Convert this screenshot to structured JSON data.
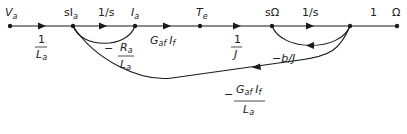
{
  "diagram": {
    "type": "signal-flow-graph",
    "nodes": [
      {
        "id": "Va",
        "label": "V_a",
        "x": 10,
        "y": 26
      },
      {
        "id": "sIa",
        "label": "sI_a",
        "x": 73,
        "y": 26
      },
      {
        "id": "Ia",
        "label": "I_a",
        "x": 135,
        "y": 26
      },
      {
        "id": "Te",
        "label": "T_e",
        "x": 200,
        "y": 26
      },
      {
        "id": "sOmega",
        "label": "sΩ",
        "x": 272,
        "y": 26
      },
      {
        "id": "n6",
        "label": "",
        "x": 350,
        "y": 26
      },
      {
        "id": "Omega",
        "label": "Ω",
        "x": 397,
        "y": 26
      }
    ],
    "labels": {
      "va": "V",
      "va_sub": "a",
      "sia": "sI",
      "sia_sub": "a",
      "ia": "I",
      "ia_sub": "a",
      "te": "T",
      "te_sub": "e",
      "somega": "sΩ",
      "omega": "Ω",
      "gain_1_over_s_a": "1/s",
      "gain_1_over_s_b": "1/s",
      "gain_one": "1",
      "gain_1_over_La_num": "1",
      "gain_1_over_La_den": "L",
      "gain_1_over_La_den_sub": "a",
      "gain_Ra_minus": "−",
      "gain_Ra_num": "R",
      "gain_Ra_num_sub": "a",
      "gain_Ra_den": "L",
      "gain_Ra_den_sub": "a",
      "gain_GafIf_G": "G",
      "gain_GafIf_G_sub": "af",
      "gain_GafIf_I": "I",
      "gain_GafIf_I_sub": "f",
      "gain_1_over_J_num": "1",
      "gain_1_over_J_den": "J",
      "gain_bJ": "−b/J",
      "gain_fb_minus": "−",
      "gain_fb_G": "G",
      "gain_fb_G_sub": "af",
      "gain_fb_I": "I",
      "gain_fb_I_sub": "f",
      "gain_fb_den": "L",
      "gain_fb_den_sub": "a"
    },
    "edges": [
      {
        "from": "Va",
        "to": "sIa",
        "gain": "1/L_a"
      },
      {
        "from": "sIa",
        "to": "Ia",
        "gain": "1/s"
      },
      {
        "from": "Ia",
        "to": "sIa",
        "gain": "-R_a/L_a"
      },
      {
        "from": "Ia",
        "to": "Te",
        "gain": "G_af I_f"
      },
      {
        "from": "Te",
        "to": "sOmega",
        "gain": "1/J"
      },
      {
        "from": "sOmega",
        "to": "n6",
        "gain": "1/s"
      },
      {
        "from": "n6",
        "to": "sOmega",
        "gain": "-b/J"
      },
      {
        "from": "n6",
        "to": "Omega",
        "gain": "1"
      },
      {
        "from": "n6",
        "to": "sIa",
        "gain": "-G_af I_f / L_a"
      }
    ],
    "colors": {
      "line": "#1a1a1a",
      "text": "#222222"
    }
  }
}
